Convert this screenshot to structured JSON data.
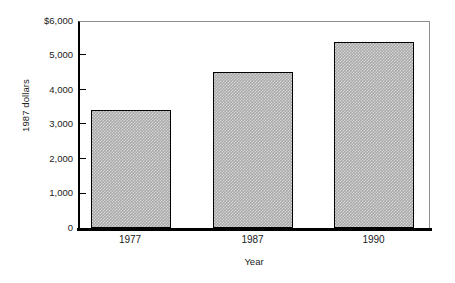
{
  "chart_data": {
    "type": "bar",
    "title": "",
    "categories": [
      "1977",
      "1987",
      "1990"
    ],
    "values": [
      3430,
      4520,
      5380
    ],
    "series": [
      {
        "name": "1987 dollars",
        "values": [
          3430,
          4520,
          5380
        ]
      }
    ],
    "xlabel": "Year",
    "ylabel": "1987 dollars",
    "ylim": [
      0,
      6000
    ],
    "ytick_values": [
      0,
      1000,
      2000,
      3000,
      4000,
      5000,
      6000
    ],
    "ytick_labels": [
      "0",
      "1,000",
      "2,000",
      "3,000",
      "4,000",
      "5,000",
      "$6,000"
    ],
    "grid": false,
    "legend": "none",
    "bar_fill": "#a8a8a8",
    "bar_edge": "#000000",
    "axis_color": "#000000",
    "frame_color": "#8e8e8e"
  },
  "axes": {
    "y_title": "1987 dollars",
    "x_title": "Year"
  },
  "ticks": {
    "y": [
      {
        "label": "$6,000",
        "value": 6000
      },
      {
        "label": "5,000",
        "value": 5000
      },
      {
        "label": "4,000",
        "value": 4000
      },
      {
        "label": "3,000",
        "value": 3000
      },
      {
        "label": "2,000",
        "value": 2000
      },
      {
        "label": "1,000",
        "value": 1000
      },
      {
        "label": "0",
        "value": 0
      }
    ]
  },
  "bars": [
    {
      "category": "1977",
      "value": 3430
    },
    {
      "category": "1987",
      "value": 4520
    },
    {
      "category": "1990",
      "value": 5380
    }
  ]
}
